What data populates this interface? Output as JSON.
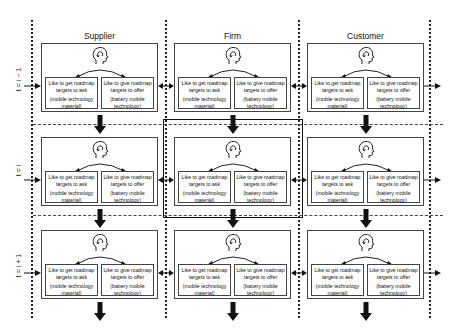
{
  "columns": [
    {
      "title": "Supplier"
    },
    {
      "title": "Firm"
    },
    {
      "title": "Customer"
    }
  ],
  "rows": [
    {
      "label": "t = i − 1"
    },
    {
      "label": "t = i"
    },
    {
      "label": "t = i + 1"
    }
  ],
  "cell": {
    "left_box": {
      "line1": "Like to get roadmap",
      "line2": "targets to ask",
      "line3": "(mobile technology",
      "line4": "material)"
    },
    "right_box": {
      "line1": "Like to give roadmap",
      "line2": "targets to offer",
      "line3": "(battery mobile",
      "line4": "technology)"
    },
    "icon": "head-with-circular-arrow-icon"
  },
  "highlight": {
    "row": 1,
    "column": 1,
    "color": "#111111"
  }
}
